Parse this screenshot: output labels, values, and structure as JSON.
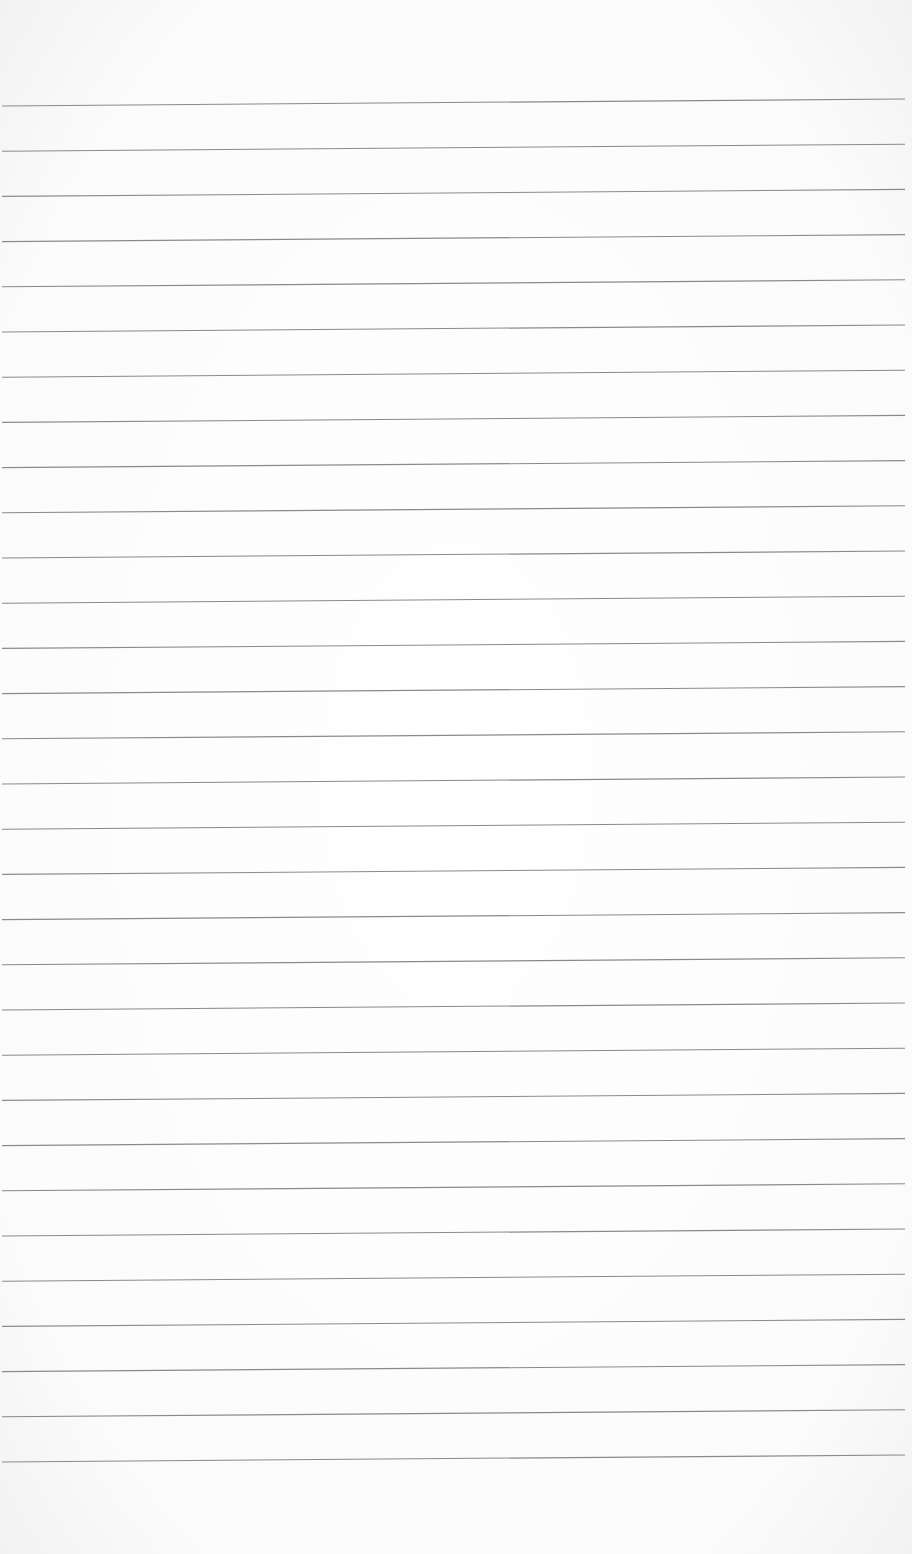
{
  "page": {
    "type": "lined-paper",
    "line_count": 31,
    "line_color": "#8a8a8a",
    "background_color": "#fdfdfd",
    "first_line_y_left": 106,
    "first_line_y_right": 99,
    "line_spacing": 45.2
  }
}
